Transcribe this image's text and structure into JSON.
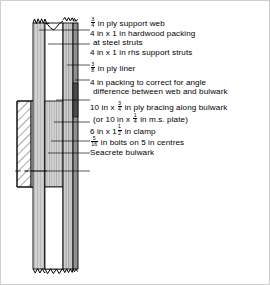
{
  "figure": {
    "type": "engineering-cross-section",
    "ink_color": "#000000",
    "hatch_color": "#000000",
    "fill_light": "#e8e8e8",
    "fill_mid": "#c9c9c9",
    "fill_dark": "#9a9a9a"
  },
  "callouts": [
    {
      "id": "ply-support-web",
      "lines": [
        {
          "parts": [
            {
              "t": "frac",
              "n": "3",
              "d": "4"
            },
            {
              "t": "text",
              "v": " in ply support web"
            }
          ]
        }
      ]
    },
    {
      "id": "hardwood-packing",
      "lines": [
        {
          "parts": [
            {
              "t": "text",
              "v": "4 in x 1 in hardwood packing"
            }
          ]
        },
        {
          "parts": [
            {
              "t": "text",
              "v": "at steel struts"
            }
          ],
          "cont": true
        }
      ]
    },
    {
      "id": "rhs-support-struts",
      "lines": [
        {
          "parts": [
            {
              "t": "text",
              "v": "4 in x 1 in rhs support struts"
            }
          ]
        }
      ]
    },
    {
      "id": "ply-liner",
      "lines": [
        {
          "parts": [
            {
              "t": "frac",
              "n": "3",
              "d": "8"
            },
            {
              "t": "text",
              "v": " in ply liner"
            }
          ]
        }
      ]
    },
    {
      "id": "angle-packing",
      "lines": [
        {
          "parts": [
            {
              "t": "text",
              "v": "4 in packing to correct for angle"
            }
          ]
        },
        {
          "parts": [
            {
              "t": "text",
              "v": "difference between web and bulwark"
            }
          ],
          "cont": true
        }
      ]
    },
    {
      "id": "ply-bracing",
      "lines": [
        {
          "parts": [
            {
              "t": "text",
              "v": "10 in x "
            },
            {
              "t": "frac",
              "n": "3",
              "d": "4"
            },
            {
              "t": "text",
              "v": " in ply bracing along bulwark"
            }
          ]
        },
        {
          "parts": [
            {
              "t": "text",
              "v": "(or 10 in x "
            },
            {
              "t": "frac",
              "n": "1",
              "d": "4"
            },
            {
              "t": "text",
              "v": " in m.s. plate)"
            }
          ],
          "cont": true
        }
      ]
    },
    {
      "id": "clamp",
      "lines": [
        {
          "parts": [
            {
              "t": "text",
              "v": "6 in x 1"
            },
            {
              "t": "frac",
              "n": "1",
              "d": "2"
            },
            {
              "t": "text",
              "v": " in clamp"
            }
          ]
        }
      ]
    },
    {
      "id": "bolts",
      "lines": [
        {
          "parts": [
            {
              "t": "frac",
              "n": "5",
              "d": "16"
            },
            {
              "t": "text",
              "v": " in bolts on 5 in centres"
            }
          ]
        }
      ]
    },
    {
      "id": "seacrete-bulwark",
      "lines": [
        {
          "parts": [
            {
              "t": "text",
              "v": "Seacrete bulwark"
            }
          ]
        }
      ]
    }
  ]
}
